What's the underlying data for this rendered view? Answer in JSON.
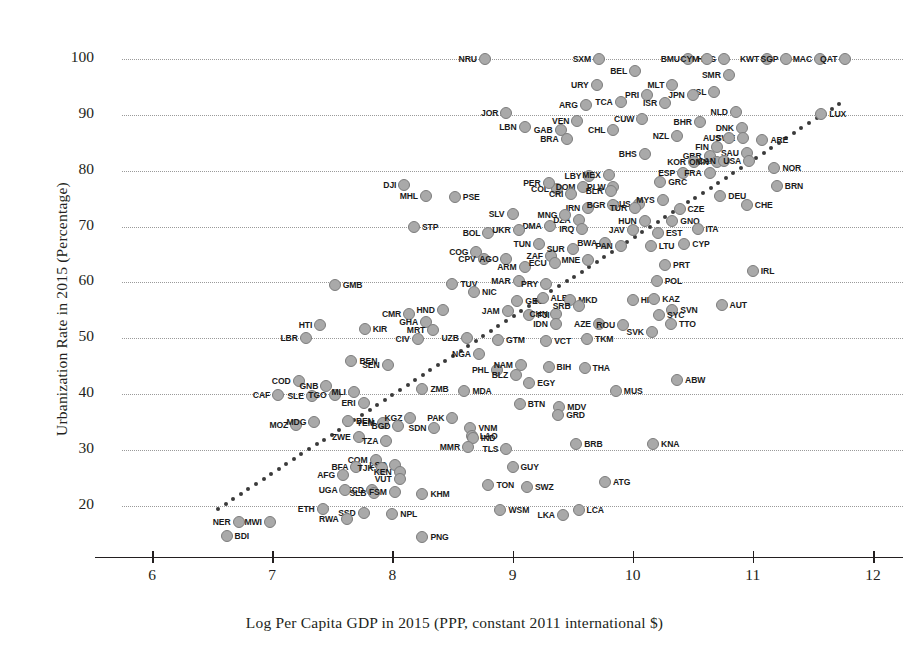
{
  "chart_data": {
    "type": "scatter",
    "title": "",
    "xlabel": "Log Per Capita GDP in 2015 (PPP, constant 2011 international $)",
    "ylabel": "Urbanization Rate in 2015 (Percentage)",
    "xlim": [
      5.75,
      12.25
    ],
    "ylim": [
      13,
      102.5
    ],
    "xticks": [
      6,
      7,
      8,
      9,
      10,
      11,
      12
    ],
    "yticks": [
      20,
      30,
      40,
      50,
      60,
      70,
      80,
      90,
      100
    ],
    "grid": "horizontal-dotted",
    "legend": "none",
    "marker_color": "#a9a9a9",
    "marker_edge_color": "#7d7d7d",
    "trendline": {
      "style": "dotted",
      "color": "#3a3a3a",
      "x_start": 6.55,
      "y_start": 19.5,
      "x_end": 11.72,
      "y_end": 92.0
    },
    "point_label_format": "ISO3 country code",
    "points": [
      {
        "label": "NRU",
        "x": 8.77,
        "y": 100.0
      },
      {
        "label": "SXM",
        "x": 9.72,
        "y": 100.0
      },
      {
        "label": "BMU",
        "x": 10.46,
        "y": 100.0
      },
      {
        "label": "HKG",
        "x": 10.76,
        "y": 100.0
      },
      {
        "label": "KWT",
        "x": 11.12,
        "y": 100.0
      },
      {
        "label": "MAC",
        "x": 11.56,
        "y": 100.0
      },
      {
        "label": "CYM",
        "x": 10.62,
        "y": 100.0
      },
      {
        "label": "SGP",
        "x": 11.28,
        "y": 100.0
      },
      {
        "label": "QAT",
        "x": 11.77,
        "y": 100.0
      },
      {
        "label": "BEL",
        "x": 10.02,
        "y": 97.9
      },
      {
        "label": "SMR",
        "x": 10.8,
        "y": 97.2
      },
      {
        "label": "URY",
        "x": 9.7,
        "y": 95.3
      },
      {
        "label": "MLT",
        "x": 10.33,
        "y": 95.4
      },
      {
        "label": "PRI",
        "x": 10.12,
        "y": 93.6
      },
      {
        "label": "ISL",
        "x": 10.68,
        "y": 94.0
      },
      {
        "label": "ARG",
        "x": 9.61,
        "y": 91.8
      },
      {
        "label": "TCA",
        "x": 9.9,
        "y": 92.3
      },
      {
        "label": "ISR",
        "x": 10.27,
        "y": 92.1
      },
      {
        "label": "JPN",
        "x": 10.5,
        "y": 93.5
      },
      {
        "label": "JOR",
        "x": 8.95,
        "y": 90.3
      },
      {
        "label": "LBN",
        "x": 9.1,
        "y": 87.8
      },
      {
        "label": "GAB",
        "x": 9.4,
        "y": 87.2
      },
      {
        "label": "CUW",
        "x": 10.08,
        "y": 89.3
      },
      {
        "label": "NLD",
        "x": 10.86,
        "y": 90.5
      },
      {
        "label": "BHR",
        "x": 10.56,
        "y": 88.8
      },
      {
        "label": "VEN",
        "x": 9.54,
        "y": 88.9
      },
      {
        "label": "CHL",
        "x": 9.84,
        "y": 87.2
      },
      {
        "label": "NZL",
        "x": 10.37,
        "y": 86.3
      },
      {
        "label": "DNK",
        "x": 10.91,
        "y": 87.7
      },
      {
        "label": "SWE",
        "x": 10.92,
        "y": 85.8
      },
      {
        "label": "BRA",
        "x": 9.45,
        "y": 85.7
      },
      {
        "label": "FIN",
        "x": 10.7,
        "y": 84.2
      },
      {
        "label": "AUS",
        "x": 10.8,
        "y": 85.9
      },
      {
        "label": "SAU",
        "x": 10.95,
        "y": 83.1
      },
      {
        "label": "ARE",
        "x": 11.08,
        "y": 85.5
      },
      {
        "label": "LUX",
        "x": 11.57,
        "y": 90.2
      },
      {
        "label": "BHS",
        "x": 10.1,
        "y": 82.9
      },
      {
        "label": "GBR",
        "x": 10.64,
        "y": 82.6
      },
      {
        "label": "KOR",
        "x": 10.51,
        "y": 81.6
      },
      {
        "label": "OMN",
        "x": 10.7,
        "y": 81.6
      },
      {
        "label": "CAN",
        "x": 10.76,
        "y": 81.8
      },
      {
        "label": "USA",
        "x": 10.97,
        "y": 81.7
      },
      {
        "label": "NOR",
        "x": 11.18,
        "y": 80.5
      },
      {
        "label": "LBY",
        "x": 9.64,
        "y": 79.0
      },
      {
        "label": "COL",
        "x": 9.37,
        "y": 76.7
      },
      {
        "label": "MEX",
        "x": 9.8,
        "y": 79.2
      },
      {
        "label": "ESP",
        "x": 10.42,
        "y": 79.6
      },
      {
        "label": "FRA",
        "x": 10.64,
        "y": 79.5
      },
      {
        "label": "PER",
        "x": 9.3,
        "y": 77.8
      },
      {
        "label": "DOM",
        "x": 9.59,
        "y": 77.0
      },
      {
        "label": "PLW",
        "x": 9.84,
        "y": 77.0
      },
      {
        "label": "GRC",
        "x": 10.23,
        "y": 78.0
      },
      {
        "label": "CRI",
        "x": 9.49,
        "y": 75.8
      },
      {
        "label": "BLR",
        "x": 9.82,
        "y": 76.4
      },
      {
        "label": "RUS",
        "x": 10.05,
        "y": 74.0
      },
      {
        "label": "MYS",
        "x": 10.25,
        "y": 74.7
      },
      {
        "label": "DEU",
        "x": 10.73,
        "y": 75.5
      },
      {
        "label": "BRN",
        "x": 11.2,
        "y": 77.2
      },
      {
        "label": "DJI",
        "x": 8.1,
        "y": 77.4
      },
      {
        "label": "MHL",
        "x": 8.28,
        "y": 75.4
      },
      {
        "label": "PSE",
        "x": 8.52,
        "y": 75.3
      },
      {
        "label": "IRN",
        "x": 9.63,
        "y": 73.4
      },
      {
        "label": "BGR",
        "x": 9.84,
        "y": 73.9
      },
      {
        "label": "TUR",
        "x": 10.02,
        "y": 73.4
      },
      {
        "label": "CZE",
        "x": 10.39,
        "y": 73.1
      },
      {
        "label": "CHE",
        "x": 10.95,
        "y": 73.9
      },
      {
        "label": "SLV",
        "x": 9.0,
        "y": 72.2
      },
      {
        "label": "DMA",
        "x": 9.31,
        "y": 70.1
      },
      {
        "label": "DZA",
        "x": 9.55,
        "y": 71.2
      },
      {
        "label": "HUN",
        "x": 10.1,
        "y": 71.0
      },
      {
        "label": "GNQ",
        "x": 10.33,
        "y": 71.0
      },
      {
        "label": "STP",
        "x": 8.18,
        "y": 70.0
      },
      {
        "label": "BOL",
        "x": 8.8,
        "y": 68.8
      },
      {
        "label": "UKR",
        "x": 9.05,
        "y": 69.3
      },
      {
        "label": "IRQ",
        "x": 9.58,
        "y": 69.5
      },
      {
        "label": "JAV",
        "x": 10.0,
        "y": 69.3
      },
      {
        "label": "EST",
        "x": 10.21,
        "y": 68.9
      },
      {
        "label": "ITA",
        "x": 10.54,
        "y": 69.6
      },
      {
        "label": "TUN",
        "x": 9.22,
        "y": 66.8
      },
      {
        "label": "MNG",
        "x": 9.44,
        "y": 72.0
      },
      {
        "label": "BWA",
        "x": 9.77,
        "y": 67.0
      },
      {
        "label": "PAN",
        "x": 9.9,
        "y": 66.6
      },
      {
        "label": "LTU",
        "x": 10.15,
        "y": 66.5
      },
      {
        "label": "CYP",
        "x": 10.43,
        "y": 66.9
      },
      {
        "label": "ZAF",
        "x": 9.32,
        "y": 64.8
      },
      {
        "label": "SUR",
        "x": 9.5,
        "y": 66.0
      },
      {
        "label": "MNE",
        "x": 9.63,
        "y": 64.0
      },
      {
        "label": "COG",
        "x": 8.7,
        "y": 65.4
      },
      {
        "label": "CPV",
        "x": 8.76,
        "y": 64.2
      },
      {
        "label": "AGO",
        "x": 8.95,
        "y": 64.2
      },
      {
        "label": "ARM",
        "x": 9.1,
        "y": 62.7
      },
      {
        "label": "ECU",
        "x": 9.35,
        "y": 63.5
      },
      {
        "label": "PRT",
        "x": 10.27,
        "y": 63.1
      },
      {
        "label": "IRL",
        "x": 11.0,
        "y": 62.1
      },
      {
        "label": "MAR",
        "x": 9.05,
        "y": 60.3
      },
      {
        "label": "PRY",
        "x": 9.28,
        "y": 59.8
      },
      {
        "label": "POL",
        "x": 10.2,
        "y": 60.3
      },
      {
        "label": "GMB",
        "x": 7.52,
        "y": 59.5
      },
      {
        "label": "TUV",
        "x": 8.5,
        "y": 59.7
      },
      {
        "label": "NIC",
        "x": 8.68,
        "y": 58.3
      },
      {
        "label": "GEO",
        "x": 9.04,
        "y": 56.7
      },
      {
        "label": "ALB",
        "x": 9.25,
        "y": 57.2
      },
      {
        "label": "MKD",
        "x": 9.48,
        "y": 56.8
      },
      {
        "label": "HRV",
        "x": 10.0,
        "y": 56.9
      },
      {
        "label": "KAZ",
        "x": 10.18,
        "y": 57.1
      },
      {
        "label": "AUT",
        "x": 10.74,
        "y": 56.0
      },
      {
        "label": "CMR",
        "x": 8.14,
        "y": 54.4
      },
      {
        "label": "HND",
        "x": 8.42,
        "y": 55.0
      },
      {
        "label": "JAM",
        "x": 8.96,
        "y": 54.8
      },
      {
        "label": "FJI",
        "x": 9.14,
        "y": 54.1
      },
      {
        "label": "CHN",
        "x": 9.36,
        "y": 54.3
      },
      {
        "label": "SRB",
        "x": 9.55,
        "y": 55.7
      },
      {
        "label": "SVN",
        "x": 10.33,
        "y": 55.0
      },
      {
        "label": "SYC",
        "x": 10.22,
        "y": 54.1
      },
      {
        "label": "GHA",
        "x": 8.28,
        "y": 53.0
      },
      {
        "label": "MRT",
        "x": 8.34,
        "y": 51.4
      },
      {
        "label": "IDN",
        "x": 9.36,
        "y": 52.5
      },
      {
        "label": "AZE",
        "x": 9.72,
        "y": 52.5
      },
      {
        "label": "ROU",
        "x": 9.92,
        "y": 52.3
      },
      {
        "label": "TTO",
        "x": 10.32,
        "y": 52.5
      },
      {
        "label": "SVK",
        "x": 10.16,
        "y": 51.2
      },
      {
        "label": "HTI",
        "x": 7.4,
        "y": 52.3
      },
      {
        "label": "KIR",
        "x": 7.77,
        "y": 51.7
      },
      {
        "label": "LBR",
        "x": 7.28,
        "y": 50.0
      },
      {
        "label": "CIV",
        "x": 8.21,
        "y": 49.9
      },
      {
        "label": "UZB",
        "x": 8.62,
        "y": 50.1
      },
      {
        "label": "GTM",
        "x": 8.88,
        "y": 49.7
      },
      {
        "label": "VCT",
        "x": 9.28,
        "y": 49.5
      },
      {
        "label": "TKM",
        "x": 9.62,
        "y": 49.9
      },
      {
        "label": "BEN",
        "x": 7.66,
        "y": 45.9
      },
      {
        "label": "SEN",
        "x": 7.96,
        "y": 45.3
      },
      {
        "label": "NGA",
        "x": 8.72,
        "y": 47.1
      },
      {
        "label": "PHL",
        "x": 8.87,
        "y": 44.4
      },
      {
        "label": "NAM",
        "x": 9.07,
        "y": 45.2
      },
      {
        "label": "BLZ",
        "x": 9.03,
        "y": 43.5
      },
      {
        "label": "BIH",
        "x": 9.3,
        "y": 44.9
      },
      {
        "label": "THA",
        "x": 9.6,
        "y": 44.7
      },
      {
        "label": "COD",
        "x": 7.22,
        "y": 42.4
      },
      {
        "label": "GNB",
        "x": 7.45,
        "y": 41.5
      },
      {
        "label": "SLE",
        "x": 7.33,
        "y": 39.6
      },
      {
        "label": "TGO",
        "x": 7.52,
        "y": 39.8
      },
      {
        "label": "MLI",
        "x": 7.68,
        "y": 40.3
      },
      {
        "label": "ZMB",
        "x": 8.25,
        "y": 40.9
      },
      {
        "label": "MDA",
        "x": 8.6,
        "y": 40.6
      },
      {
        "label": "EGY",
        "x": 9.14,
        "y": 42.0
      },
      {
        "label": "MUS",
        "x": 9.86,
        "y": 40.6
      },
      {
        "label": "ABW",
        "x": 10.37,
        "y": 42.6
      },
      {
        "label": "CAF",
        "x": 7.05,
        "y": 39.8
      },
      {
        "label": "ERI",
        "x": 7.76,
        "y": 38.4
      },
      {
        "label": "BTN",
        "x": 9.06,
        "y": 38.3
      },
      {
        "label": "MDV",
        "x": 9.39,
        "y": 37.7
      },
      {
        "label": "GRD",
        "x": 9.38,
        "y": 36.2
      },
      {
        "label": "MOZ",
        "x": 7.2,
        "y": 34.5
      },
      {
        "label": "MDG",
        "x": 7.35,
        "y": 35.0
      },
      {
        "label": "BEN2",
        "x": 7.63,
        "y": 35.2
      },
      {
        "label": "YEM",
        "x": 7.92,
        "y": 34.8
      },
      {
        "label": "KGZ",
        "x": 8.15,
        "y": 35.7
      },
      {
        "label": "BGD",
        "x": 8.05,
        "y": 34.3
      },
      {
        "label": "PAK",
        "x": 8.5,
        "y": 35.8
      },
      {
        "label": "SDN",
        "x": 8.35,
        "y": 34.0
      },
      {
        "label": "VNM",
        "x": 8.65,
        "y": 34.0
      },
      {
        "label": "LAO",
        "x": 8.66,
        "y": 32.6
      },
      {
        "label": "IND",
        "x": 8.67,
        "y": 32.1
      },
      {
        "label": "ZWE",
        "x": 7.72,
        "y": 32.4
      },
      {
        "label": "TZA",
        "x": 7.95,
        "y": 31.6
      },
      {
        "label": "MMR",
        "x": 8.63,
        "y": 30.5
      },
      {
        "label": "TLS",
        "x": 8.95,
        "y": 30.1
      },
      {
        "label": "BRB",
        "x": 9.53,
        "y": 31.0
      },
      {
        "label": "KNA",
        "x": 10.17,
        "y": 31.0
      },
      {
        "label": "COM",
        "x": 7.86,
        "y": 28.2
      },
      {
        "label": "LSO",
        "x": 8.02,
        "y": 27.4
      },
      {
        "label": "BFA",
        "x": 7.7,
        "y": 26.9
      },
      {
        "label": "TJK",
        "x": 7.91,
        "y": 26.7
      },
      {
        "label": "KEN",
        "x": 8.06,
        "y": 26.0
      },
      {
        "label": "GUY",
        "x": 9.0,
        "y": 26.9
      },
      {
        "label": "AFG",
        "x": 7.59,
        "y": 25.5
      },
      {
        "label": "VUT",
        "x": 8.06,
        "y": 24.9
      },
      {
        "label": "TCD",
        "x": 7.83,
        "y": 22.8
      },
      {
        "label": "ATG",
        "x": 9.77,
        "y": 24.3
      },
      {
        "label": "TON",
        "x": 8.8,
        "y": 23.7
      },
      {
        "label": "SWZ",
        "x": 9.12,
        "y": 23.4
      },
      {
        "label": "UGA",
        "x": 7.61,
        "y": 22.8
      },
      {
        "label": "SLB",
        "x": 7.85,
        "y": 22.3
      },
      {
        "label": "FSM",
        "x": 8.02,
        "y": 22.4
      },
      {
        "label": "KHM",
        "x": 8.25,
        "y": 22.2
      },
      {
        "label": "ETH",
        "x": 7.42,
        "y": 19.5
      },
      {
        "label": "SSD",
        "x": 7.76,
        "y": 18.8
      },
      {
        "label": "NPL",
        "x": 8.0,
        "y": 18.6
      },
      {
        "label": "WSM",
        "x": 8.9,
        "y": 19.2
      },
      {
        "label": "RWA",
        "x": 7.62,
        "y": 17.6
      },
      {
        "label": "LKA",
        "x": 9.42,
        "y": 18.4
      },
      {
        "label": "LCA",
        "x": 9.55,
        "y": 19.2
      },
      {
        "label": "NER",
        "x": 6.72,
        "y": 17.2
      },
      {
        "label": "MWI",
        "x": 6.98,
        "y": 17.1
      },
      {
        "label": "BDI",
        "x": 6.62,
        "y": 14.6
      },
      {
        "label": "PNG",
        "x": 8.25,
        "y": 14.5
      }
    ],
    "label_offsets": {
      "default": "right",
      "left_labeled": [
        "NRU",
        "SXM",
        "BMU",
        "KWT",
        "MAC",
        "SGP",
        "CYM",
        "QAT",
        "BEL",
        "SMR",
        "URY",
        "MLT",
        "PRI",
        "ARG",
        "TCA",
        "ISR",
        "JPN",
        "JOR",
        "LBN",
        "GAB",
        "CUW",
        "BHR",
        "VEN",
        "CHL",
        "NZL",
        "DNK",
        "SWE",
        "BRA",
        "FIN",
        "SAU",
        "BHS",
        "GBR",
        "KOR",
        "OMN",
        "CAN",
        "USA",
        "LBY",
        "COL",
        "MEX",
        "ESP",
        "FRA",
        "PER",
        "DOM",
        "PLW",
        "CRI",
        "BLR",
        "RUS",
        "MYS",
        "DJI",
        "MHL",
        "IRN",
        "BGR",
        "TUR",
        "SLV",
        "DMA",
        "DZA",
        "HUN",
        "BOL",
        "UKR",
        "IRQ",
        "JAV",
        "TUN",
        "MNG",
        "BWA",
        "PAN",
        "ZAF",
        "SUR",
        "MNE",
        "COG",
        "CPV",
        "AGO",
        "ARM",
        "ECU",
        "MAR",
        "PRY",
        "CMR",
        "HND",
        "JAM",
        "CHN",
        "SRB",
        "GHA",
        "MRT",
        "IDN",
        "AZE",
        "ROU",
        "SVK",
        "HTI",
        "LBR",
        "CIV",
        "UZB",
        "NGA",
        "PHL",
        "NAM",
        "BLZ",
        "COD",
        "GNB",
        "TGO",
        "MLI",
        "CAF",
        "ERI",
        "MOZ",
        "MDG",
        "YEM",
        "KGZ",
        "BGD",
        "SDN",
        "ZWE",
        "TZA",
        "MMR",
        "COM",
        "LSO",
        "BFA",
        "TJK",
        "KEN",
        "AFG",
        "VUT",
        "TCD",
        "UGA",
        "SLB",
        "FSM",
        "ETH",
        "SSD",
        "RWA",
        "LKA",
        "NER",
        "MWI",
        "SLE",
        "SEN",
        "HKG",
        "NLD",
        "AUS",
        "ISL",
        "AGO2",
        "TLS",
        "PAK"
      ]
    }
  }
}
